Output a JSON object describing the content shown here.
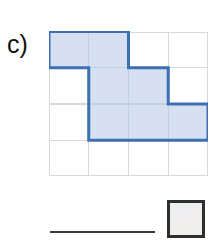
{
  "figure": {
    "part_label": "c)",
    "colors": {
      "shape_fill": "#d6e0f0",
      "shape_stroke": "#3c6fb4",
      "grid_line": "#d8d8d8",
      "rule_color": "#3b3b3b",
      "swatch_border": "#2e2e2e",
      "swatch_fill": "#eef0ee",
      "label_color": "#111111",
      "background": "#ffffff"
    }
  },
  "chart_data": {
    "type": "heatmap",
    "title": "c)",
    "xlabel": "",
    "ylabel": "",
    "grid": true,
    "legend_position": "bottom-right",
    "rows": 4,
    "cols": 4,
    "cell_width": 39.5,
    "cell_height": 36,
    "categories": [
      "col 1",
      "col 2",
      "col 3",
      "col 4"
    ],
    "row_labels": [
      "row 1",
      "row 2",
      "row 3",
      "row 4"
    ],
    "values": [
      [
        1,
        1,
        0,
        0
      ],
      [
        0,
        1,
        1,
        0
      ],
      [
        0,
        1,
        1,
        1
      ],
      [
        0,
        0,
        0,
        0
      ]
    ],
    "shaded_cells": [
      {
        "row": 1,
        "col": 1
      },
      {
        "row": 1,
        "col": 2
      },
      {
        "row": 2,
        "col": 2
      },
      {
        "row": 2,
        "col": 3
      },
      {
        "row": 3,
        "col": 2
      },
      {
        "row": 3,
        "col": 3
      },
      {
        "row": 3,
        "col": 4
      }
    ],
    "shaded_count": 7,
    "total_cells": 16,
    "outline_path": "M0,0 H79 V36 H119 V72 H158 V108 H39.5 V36 H0 Z",
    "annotations": []
  },
  "legend": {
    "rule_label": "",
    "swatch_label": ""
  }
}
